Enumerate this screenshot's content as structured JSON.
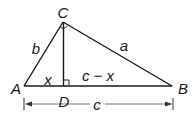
{
  "diagram": {
    "type": "right-triangle-with-altitude",
    "stroke_color": "#1a1a1a",
    "dimension_color": "#555555",
    "vertices": {
      "A": {
        "label": "A",
        "x": 24,
        "y": 86
      },
      "B": {
        "label": "B",
        "x": 172,
        "y": 86
      },
      "C": {
        "label": "C",
        "x": 63,
        "y": 22
      },
      "D": {
        "label": "D",
        "x": 64,
        "y": 86
      }
    },
    "sides": {
      "a": "a",
      "b": "b",
      "x": "x",
      "c_minus_x": "c − x",
      "c": "c"
    },
    "right_angle_markers": [
      "at C",
      "at D"
    ]
  }
}
